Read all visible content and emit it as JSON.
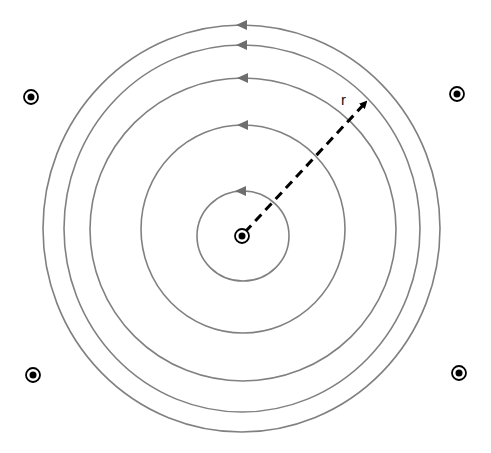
{
  "diagram": {
    "center_wire": {
      "symbol": "dot-in-circle",
      "meaning": "current out of page",
      "x": 242,
      "y": 236
    },
    "radius_label": "r",
    "field_circles": [
      {
        "id": "ring-1",
        "cx": 243,
        "cy": 236,
        "rx": 46,
        "ry": 45
      },
      {
        "id": "ring-2",
        "cx": 243,
        "cy": 229,
        "rx": 102,
        "ry": 104
      },
      {
        "id": "ring-3",
        "cx": 243,
        "cy": 229.5,
        "rx": 153,
        "ry": 151.5
      },
      {
        "id": "ring-4",
        "cx": 242,
        "cy": 228.5,
        "rx": 178,
        "ry": 183.5
      },
      {
        "id": "ring-5",
        "cx": 241.5,
        "cy": 228.5,
        "rx": 198.5,
        "ry": 203.5
      }
    ],
    "direction": "counterclockwise",
    "corner_wires": [
      {
        "id": "top-left",
        "x": 31,
        "y": 97
      },
      {
        "id": "top-right",
        "x": 457,
        "y": 94
      },
      {
        "id": "bottom-left",
        "x": 33,
        "y": 375
      },
      {
        "id": "bottom-right",
        "x": 459,
        "y": 373
      }
    ],
    "radius_vector": {
      "from": [
        243,
        234
      ],
      "to": [
        368,
        100
      ],
      "style": "dashed",
      "label_pos": [
        343,
        104
      ]
    },
    "colors": {
      "field_line": "#808080",
      "arrow": "#6e6e6e",
      "wire": "#000000",
      "radius": "#000000"
    }
  }
}
